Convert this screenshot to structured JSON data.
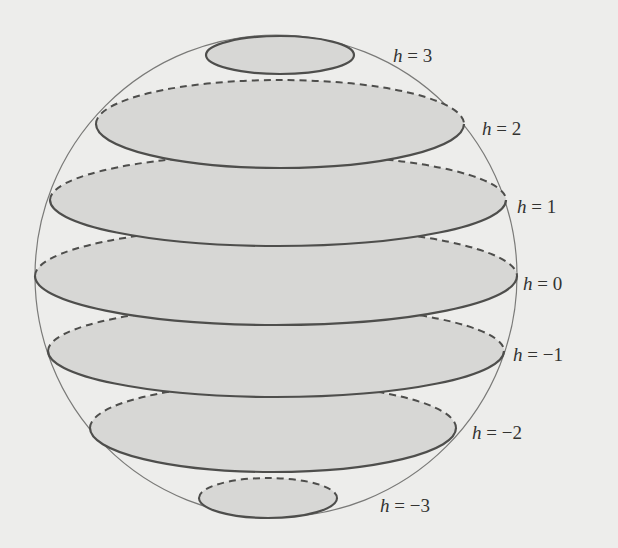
{
  "diagram": {
    "colors": {
      "background": "#ededeb",
      "sphere_outline": "#7a7a78",
      "slice_fill": "#d7d7d5",
      "slice_stroke": "#4e4e4c"
    },
    "sphere": {
      "cx": 276,
      "cy": 276,
      "r": 241
    },
    "slices": [
      {
        "h": "3",
        "label_var": "h",
        "label_eq": " = 3",
        "cx": 280,
        "cy": 55,
        "rx": 74,
        "ry": 19,
        "label_x": 393,
        "label_y": 62,
        "style": "solid"
      },
      {
        "h": "2",
        "label_var": "h",
        "label_eq": " = 2",
        "cx": 280,
        "cy": 124,
        "rx": 184,
        "ry": 44,
        "label_x": 482,
        "label_y": 135,
        "style": "front-solid-back-dashed"
      },
      {
        "h": "1",
        "label_var": "h",
        "label_eq": " = 1",
        "cx": 278,
        "cy": 200,
        "rx": 228,
        "ry": 46,
        "label_x": 517,
        "label_y": 213,
        "style": "front-solid-back-dashed"
      },
      {
        "h": "0",
        "label_var": "h",
        "label_eq": " = 0",
        "cx": 276,
        "cy": 276,
        "rx": 241,
        "ry": 49,
        "label_x": 523,
        "label_y": 290,
        "style": "front-solid-back-dashed"
      },
      {
        "h": "-1",
        "label_var": "h",
        "label_eq": " = −1",
        "cx": 276,
        "cy": 351,
        "rx": 228,
        "ry": 46,
        "label_x": 513,
        "label_y": 361,
        "style": "front-solid-back-dashed"
      },
      {
        "h": "-2",
        "label_var": "h",
        "label_eq": " = −2",
        "cx": 273,
        "cy": 428,
        "rx": 183,
        "ry": 44,
        "label_x": 472,
        "label_y": 439,
        "style": "front-solid-back-dashed"
      },
      {
        "h": "-3",
        "label_var": "h",
        "label_eq": " = −3",
        "cx": 268,
        "cy": 498,
        "rx": 69,
        "ry": 20,
        "label_x": 380,
        "label_y": 512,
        "style": "front-solid-back-dashed"
      }
    ]
  }
}
